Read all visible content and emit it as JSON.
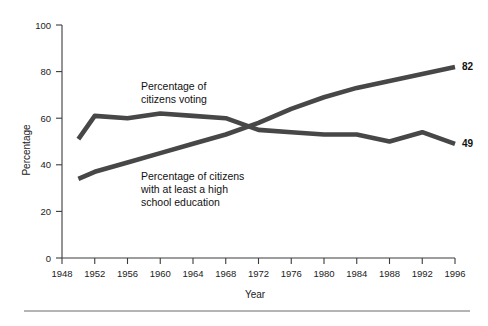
{
  "figure": {
    "background_color": "#ffffff",
    "line_color": "#474747",
    "axis_color": "#3c3c3c",
    "bottom_rule": true
  },
  "chart_data": {
    "type": "line",
    "title": "",
    "xlabel": "Year",
    "ylabel": "Percentage",
    "xlim": [
      1948,
      1996
    ],
    "ylim": [
      0,
      100
    ],
    "grid": false,
    "legend_position": "inline-annotations",
    "xticks": [
      1948,
      1952,
      1956,
      1960,
      1964,
      1968,
      1972,
      1976,
      1980,
      1984,
      1988,
      1992,
      1996
    ],
    "xtick_labels": [
      "1948",
      "1952",
      "1956",
      "1960",
      "1964",
      "1968",
      "1972",
      "1976",
      "1980",
      "1984",
      "1988",
      "1992",
      "1996"
    ],
    "yticks": [
      0,
      20,
      40,
      60,
      80,
      100
    ],
    "ytick_labels": [
      "0",
      "20",
      "40",
      "60",
      "80",
      "100"
    ],
    "x": [
      1950,
      1952,
      1956,
      1960,
      1964,
      1968,
      1972,
      1976,
      1980,
      1984,
      1988,
      1992,
      1996
    ],
    "series": [
      {
        "name": "Percentage of citizens voting",
        "annotation": "Percentage of\ncitizens voting",
        "annotation_line1": "Percentage of",
        "annotation_line2": "citizens voting",
        "end_label": "49",
        "values": [
          51,
          61,
          60,
          62,
          61,
          60,
          55,
          54,
          53,
          53,
          50,
          54,
          49
        ]
      },
      {
        "name": "Percentage of citizens with at least a high school education",
        "annotation": "Percentage of citizens\nwith at least a high\nschool education",
        "annotation_line1": "Percentage of citizens",
        "annotation_line2": "with at least a high",
        "annotation_line3": "school education",
        "end_label": "82",
        "values": [
          34,
          37,
          41,
          45,
          49,
          53,
          58,
          64,
          69,
          73,
          76,
          79,
          82
        ]
      }
    ]
  }
}
